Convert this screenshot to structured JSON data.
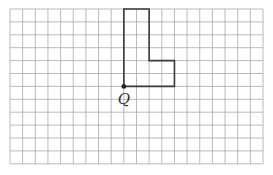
{
  "diagram": {
    "grid": {
      "columns": 20,
      "rows": 12,
      "origin_x": 10,
      "origin_y": 9,
      "cell_w": 12.65,
      "cell_h": 12.9,
      "line_color": "#a8a8a8"
    },
    "shape": {
      "name": "L-shape",
      "vertices_grid": [
        [
          9,
          6
        ],
        [
          9,
          0
        ],
        [
          11,
          0
        ],
        [
          11,
          4
        ],
        [
          13,
          4
        ],
        [
          13,
          6
        ]
      ],
      "stroke_color": "#3a3a3a"
    },
    "point": {
      "label": "Q",
      "grid_x": 9,
      "grid_y": 6,
      "color": "#222222"
    }
  }
}
